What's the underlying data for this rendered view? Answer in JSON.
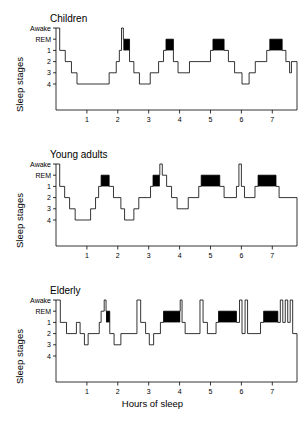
{
  "figure": {
    "background": "#ffffff",
    "line_color": "#000000",
    "rem_bar_color": "#000000",
    "y_axis_title": "Sleep stages",
    "x_axis_title": "Hours of sleep"
  },
  "axes": {
    "y_tick_labels": [
      "Awake",
      "REM",
      "1",
      "2",
      "3",
      "4"
    ],
    "y_levels": [
      0,
      1,
      2,
      3,
      4,
      5
    ],
    "x_tick_labels": [
      "1",
      "2",
      "3",
      "4",
      "5",
      "6",
      "7"
    ],
    "x_ticks": [
      1,
      2,
      3,
      4,
      5,
      6,
      7
    ],
    "xlim": [
      0,
      7.8
    ],
    "ylim": [
      0,
      5
    ],
    "grid": false,
    "legend": "none"
  },
  "chart_data": {
    "type": "line",
    "subtitle": "Hypnograms comparing children, young adults and elderly",
    "xlabel": "Hours of sleep",
    "ylabel": "Sleep stages",
    "xlim": [
      0,
      7.8
    ],
    "ylim": [
      0,
      5
    ],
    "y_categories": [
      "Awake",
      "REM",
      "1",
      "2",
      "3",
      "4"
    ],
    "y_category_values": [
      0,
      1,
      2,
      3,
      4,
      5
    ],
    "x_ticks": [
      1,
      2,
      3,
      4,
      5,
      6,
      7
    ],
    "grid": false,
    "legend": "none",
    "note": "Step plot. y values are stage indices: 0=Awake, 1=REM, 2=stage1, 3=stage2, 4=stage3, 5=stage4. REM episodes drawn as filled black bars spanning y 1 to 2.",
    "series": [
      {
        "name": "Children",
        "panel": 1,
        "steps": [
          {
            "x0": 0.0,
            "x1": 0.12,
            "y": 0
          },
          {
            "x0": 0.12,
            "x1": 0.3,
            "y": 2
          },
          {
            "x0": 0.3,
            "x1": 0.5,
            "y": 3
          },
          {
            "x0": 0.5,
            "x1": 0.68,
            "y": 4
          },
          {
            "x0": 0.68,
            "x1": 1.72,
            "y": 5
          },
          {
            "x0": 1.72,
            "x1": 1.95,
            "y": 4
          },
          {
            "x0": 1.95,
            "x1": 2.05,
            "y": 3
          },
          {
            "x0": 2.05,
            "x1": 2.12,
            "y": 2
          },
          {
            "x0": 2.12,
            "x1": 2.18,
            "y": 0
          },
          {
            "x0": 2.18,
            "x1": 2.38,
            "y": 1
          },
          {
            "x0": 2.38,
            "x1": 2.52,
            "y": 3
          },
          {
            "x0": 2.52,
            "x1": 2.7,
            "y": 4
          },
          {
            "x0": 2.7,
            "x1": 3.05,
            "y": 5
          },
          {
            "x0": 3.05,
            "x1": 3.32,
            "y": 4
          },
          {
            "x0": 3.32,
            "x1": 3.48,
            "y": 3
          },
          {
            "x0": 3.48,
            "x1": 3.56,
            "y": 2
          },
          {
            "x0": 3.56,
            "x1": 3.8,
            "y": 1
          },
          {
            "x0": 3.8,
            "x1": 3.95,
            "y": 3
          },
          {
            "x0": 3.95,
            "x1": 4.32,
            "y": 4
          },
          {
            "x0": 4.32,
            "x1": 5.0,
            "y": 3
          },
          {
            "x0": 5.0,
            "x1": 5.08,
            "y": 2
          },
          {
            "x0": 5.08,
            "x1": 5.44,
            "y": 1
          },
          {
            "x0": 5.44,
            "x1": 5.58,
            "y": 2
          },
          {
            "x0": 5.58,
            "x1": 5.78,
            "y": 3
          },
          {
            "x0": 5.78,
            "x1": 6.02,
            "y": 4
          },
          {
            "x0": 6.02,
            "x1": 6.25,
            "y": 5
          },
          {
            "x0": 6.25,
            "x1": 6.45,
            "y": 4
          },
          {
            "x0": 6.45,
            "x1": 6.82,
            "y": 3
          },
          {
            "x0": 6.82,
            "x1": 6.92,
            "y": 2
          },
          {
            "x0": 6.92,
            "x1": 7.32,
            "y": 1
          },
          {
            "x0": 7.32,
            "x1": 7.44,
            "y": 2
          },
          {
            "x0": 7.44,
            "x1": 7.56,
            "y": 3
          },
          {
            "x0": 7.56,
            "x1": 7.62,
            "y": 4
          },
          {
            "x0": 7.62,
            "x1": 7.8,
            "y": 3
          }
        ],
        "rem_episodes": [
          {
            "x0": 2.18,
            "x1": 2.38
          },
          {
            "x0": 3.56,
            "x1": 3.8
          },
          {
            "x0": 5.08,
            "x1": 5.44
          },
          {
            "x0": 6.92,
            "x1": 7.32
          }
        ]
      },
      {
        "name": "Young adults",
        "panel": 2,
        "steps": [
          {
            "x0": 0.0,
            "x1": 0.12,
            "y": 0
          },
          {
            "x0": 0.12,
            "x1": 0.28,
            "y": 2
          },
          {
            "x0": 0.28,
            "x1": 0.44,
            "y": 3
          },
          {
            "x0": 0.44,
            "x1": 0.62,
            "y": 4
          },
          {
            "x0": 0.62,
            "x1": 1.12,
            "y": 5
          },
          {
            "x0": 1.12,
            "x1": 1.28,
            "y": 4
          },
          {
            "x0": 1.28,
            "x1": 1.38,
            "y": 3
          },
          {
            "x0": 1.38,
            "x1": 1.46,
            "y": 2
          },
          {
            "x0": 1.46,
            "x1": 1.72,
            "y": 1
          },
          {
            "x0": 1.72,
            "x1": 1.86,
            "y": 2
          },
          {
            "x0": 1.86,
            "x1": 2.1,
            "y": 3
          },
          {
            "x0": 2.1,
            "x1": 2.22,
            "y": 4
          },
          {
            "x0": 2.22,
            "x1": 2.52,
            "y": 5
          },
          {
            "x0": 2.52,
            "x1": 2.68,
            "y": 4
          },
          {
            "x0": 2.68,
            "x1": 3.06,
            "y": 3
          },
          {
            "x0": 3.06,
            "x1": 3.14,
            "y": 2
          },
          {
            "x0": 3.14,
            "x1": 3.36,
            "y": 1
          },
          {
            "x0": 3.36,
            "x1": 3.44,
            "y": 0
          },
          {
            "x0": 3.44,
            "x1": 3.58,
            "y": 1
          },
          {
            "x0": 3.58,
            "x1": 3.74,
            "y": 2
          },
          {
            "x0": 3.74,
            "x1": 3.92,
            "y": 3
          },
          {
            "x0": 3.92,
            "x1": 4.28,
            "y": 4
          },
          {
            "x0": 4.28,
            "x1": 4.62,
            "y": 3
          },
          {
            "x0": 4.62,
            "x1": 4.7,
            "y": 2
          },
          {
            "x0": 4.7,
            "x1": 5.3,
            "y": 1
          },
          {
            "x0": 5.3,
            "x1": 5.44,
            "y": 2
          },
          {
            "x0": 5.44,
            "x1": 5.84,
            "y": 3
          },
          {
            "x0": 5.84,
            "x1": 5.92,
            "y": 2
          },
          {
            "x0": 5.92,
            "x1": 6.0,
            "y": 0
          },
          {
            "x0": 6.0,
            "x1": 6.1,
            "y": 2
          },
          {
            "x0": 6.1,
            "x1": 6.44,
            "y": 3
          },
          {
            "x0": 6.44,
            "x1": 6.54,
            "y": 2
          },
          {
            "x0": 6.54,
            "x1": 7.12,
            "y": 1
          },
          {
            "x0": 7.12,
            "x1": 7.22,
            "y": 2
          },
          {
            "x0": 7.22,
            "x1": 7.8,
            "y": 3
          }
        ],
        "rem_episodes": [
          {
            "x0": 1.46,
            "x1": 1.72
          },
          {
            "x0": 3.14,
            "x1": 3.36
          },
          {
            "x0": 4.7,
            "x1": 5.3
          },
          {
            "x0": 6.54,
            "x1": 7.12
          }
        ]
      },
      {
        "name": "Elderly",
        "panel": 3,
        "steps": [
          {
            "x0": 0.0,
            "x1": 0.14,
            "y": 0
          },
          {
            "x0": 0.14,
            "x1": 0.34,
            "y": 2
          },
          {
            "x0": 0.34,
            "x1": 0.66,
            "y": 3
          },
          {
            "x0": 0.66,
            "x1": 0.78,
            "y": 2
          },
          {
            "x0": 0.78,
            "x1": 0.92,
            "y": 3
          },
          {
            "x0": 0.92,
            "x1": 1.04,
            "y": 4
          },
          {
            "x0": 1.04,
            "x1": 1.4,
            "y": 3
          },
          {
            "x0": 1.4,
            "x1": 1.46,
            "y": 2
          },
          {
            "x0": 1.46,
            "x1": 1.56,
            "y": 1
          },
          {
            "x0": 1.56,
            "x1": 1.62,
            "y": 0
          },
          {
            "x0": 1.62,
            "x1": 1.74,
            "y": 1
          },
          {
            "x0": 1.74,
            "x1": 1.88,
            "y": 3
          },
          {
            "x0": 1.88,
            "x1": 2.1,
            "y": 4
          },
          {
            "x0": 2.1,
            "x1": 2.62,
            "y": 3
          },
          {
            "x0": 2.62,
            "x1": 2.74,
            "y": 0
          },
          {
            "x0": 2.74,
            "x1": 2.9,
            "y": 2
          },
          {
            "x0": 2.9,
            "x1": 3.02,
            "y": 3
          },
          {
            "x0": 3.02,
            "x1": 3.16,
            "y": 4
          },
          {
            "x0": 3.16,
            "x1": 3.38,
            "y": 3
          },
          {
            "x0": 3.38,
            "x1": 3.48,
            "y": 2
          },
          {
            "x0": 3.48,
            "x1": 4.02,
            "y": 1
          },
          {
            "x0": 4.02,
            "x1": 4.08,
            "y": 0
          },
          {
            "x0": 4.08,
            "x1": 4.18,
            "y": 2
          },
          {
            "x0": 4.18,
            "x1": 4.3,
            "y": 3
          },
          {
            "x0": 4.3,
            "x1": 4.66,
            "y": 3
          },
          {
            "x0": 4.66,
            "x1": 4.76,
            "y": 0
          },
          {
            "x0": 4.76,
            "x1": 4.9,
            "y": 2
          },
          {
            "x0": 4.9,
            "x1": 5.18,
            "y": 3
          },
          {
            "x0": 5.18,
            "x1": 5.26,
            "y": 2
          },
          {
            "x0": 5.26,
            "x1": 5.84,
            "y": 1
          },
          {
            "x0": 5.84,
            "x1": 5.94,
            "y": 2
          },
          {
            "x0": 5.94,
            "x1": 6.02,
            "y": 0
          },
          {
            "x0": 6.02,
            "x1": 6.12,
            "y": 3
          },
          {
            "x0": 6.12,
            "x1": 6.2,
            "y": 0
          },
          {
            "x0": 6.2,
            "x1": 6.34,
            "y": 3
          },
          {
            "x0": 6.34,
            "x1": 6.62,
            "y": 3
          },
          {
            "x0": 6.62,
            "x1": 6.72,
            "y": 2
          },
          {
            "x0": 6.72,
            "x1": 7.18,
            "y": 1
          },
          {
            "x0": 7.18,
            "x1": 7.26,
            "y": 2
          },
          {
            "x0": 7.26,
            "x1": 7.34,
            "y": 0
          },
          {
            "x0": 7.34,
            "x1": 7.42,
            "y": 2
          },
          {
            "x0": 7.42,
            "x1": 7.5,
            "y": 0
          },
          {
            "x0": 7.5,
            "x1": 7.58,
            "y": 2
          },
          {
            "x0": 7.58,
            "x1": 7.66,
            "y": 0
          },
          {
            "x0": 7.66,
            "x1": 7.8,
            "y": 3
          }
        ],
        "rem_episodes": [
          {
            "x0": 1.62,
            "x1": 1.74
          },
          {
            "x0": 3.48,
            "x1": 4.02
          },
          {
            "x0": 5.26,
            "x1": 5.84
          },
          {
            "x0": 6.72,
            "x1": 7.18
          }
        ]
      }
    ]
  }
}
